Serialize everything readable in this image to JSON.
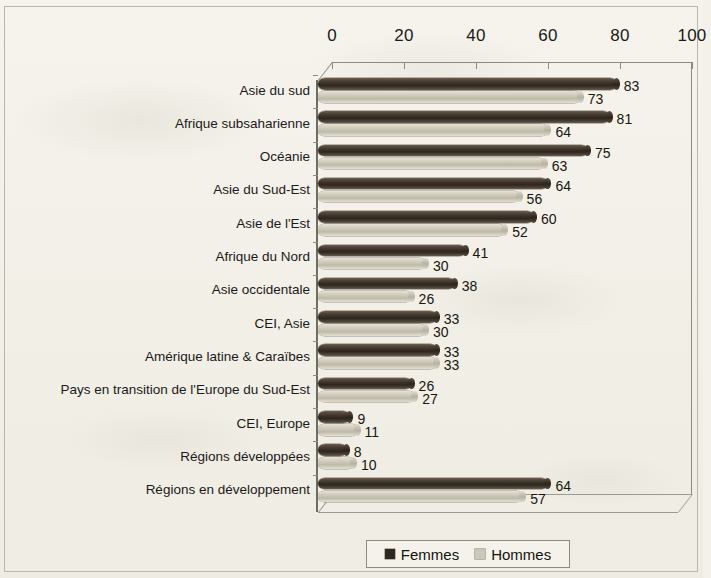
{
  "chart_data": {
    "type": "bar",
    "orientation": "horizontal",
    "title": "",
    "subtitle": "",
    "xlabel": "",
    "ylabel": "",
    "xlim": [
      0,
      100
    ],
    "xticks": [
      0,
      20,
      40,
      60,
      80,
      100
    ],
    "xtick_labels": [
      "0",
      "20",
      "40",
      "60",
      "80",
      "100"
    ],
    "grid": false,
    "legend_position": "bottom-center",
    "style": "3d-cylinder-bars",
    "categories": [
      "Asie du sud",
      "Afrique subsaharienne",
      "Océanie",
      "Asie du Sud-Est",
      "Asie de l'Est",
      "Afrique du Nord",
      "Asie occidentale",
      "CEI, Asie",
      "Amérique latine & Caraïbes",
      "Pays en transition de l'Europe du Sud-Est",
      "CEI, Europe",
      "Régions développées",
      "Régions en développement"
    ],
    "series": [
      {
        "name": "Femmes",
        "color": "#372e25",
        "values": [
          83,
          81,
          75,
          64,
          60,
          41,
          38,
          33,
          33,
          26,
          9,
          8,
          64
        ],
        "labels": [
          "83",
          "81",
          "75",
          "64",
          "60",
          "41",
          "38",
          "33",
          "33",
          "26",
          "9",
          "8",
          "64"
        ]
      },
      {
        "name": "Hommes",
        "color": "#c9c6b6",
        "values": [
          73,
          64,
          63,
          56,
          52,
          30,
          26,
          30,
          33,
          27,
          11,
          10,
          57
        ],
        "labels": [
          "73",
          "64",
          "63",
          "56",
          "52",
          "30",
          "26",
          "30",
          "33",
          "27",
          "11",
          "10",
          "57"
        ]
      }
    ]
  },
  "legend": {
    "items": [
      {
        "label": "Femmes",
        "color": "#2f2820"
      },
      {
        "label": "Hommes",
        "color": "#cbc8b8"
      }
    ]
  }
}
